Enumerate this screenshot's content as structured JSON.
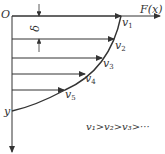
{
  "labels": {
    "origin": "O",
    "x_axis": "F(x)",
    "y_axis": "y",
    "delta": "δ",
    "v1": "v",
    "v1_sub": "1",
    "v2": "v",
    "v2_sub": "2",
    "v3": "v",
    "v3_sub": "3",
    "v4": "v",
    "v4_sub": "4",
    "v5": "v",
    "v5_sub": "5",
    "relation": "v₁>v₂>v₃>···"
  },
  "colors": {
    "line": "#333333",
    "background": "#ffffff"
  }
}
